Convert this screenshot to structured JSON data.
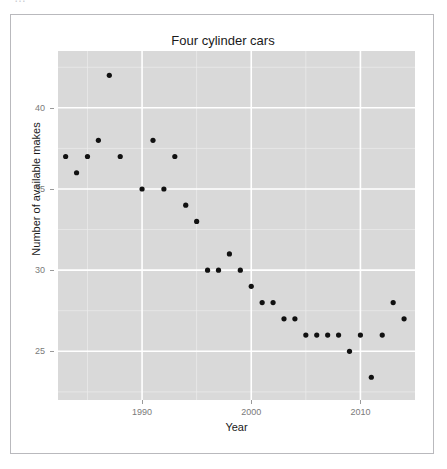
{
  "top_strip": {
    "clipped_text": "…"
  },
  "figure": {
    "title": "Four cylinder cars",
    "x_axis_title": "Year",
    "y_axis_title": "Number of available makes",
    "panel_background": "#d9d9d9",
    "point_color": "#111111",
    "major_grid_color": "#ffffff",
    "minor_grid_color": "#ececec",
    "frame_border_color": "#b9b9bd"
  },
  "chart_data": {
    "type": "scatter",
    "title": "Four cylinder cars",
    "xlabel": "Year",
    "ylabel": "Number of available makes",
    "xlim": [
      1982.2,
      1982.2
    ],
    "x_major_ticks": [
      1990,
      2000,
      2010
    ],
    "x_minor_ticks": [
      1985,
      1995,
      2005
    ],
    "y_major_ticks": [
      25,
      30,
      35,
      40
    ],
    "y_minor_ticks": [
      22.5,
      27.5,
      32.5,
      37.5,
      42.5
    ],
    "ylim": [
      22.0,
      43.5
    ],
    "x_range": [
      1982.3,
      2015.0
    ],
    "grid": true,
    "legend": "none",
    "x": [
      1983,
      1984,
      1985,
      1986,
      1987,
      1988,
      1990,
      1991,
      1992,
      1993,
      1994,
      1995,
      1996,
      1997,
      1998,
      1999,
      2000,
      2001,
      2002,
      2003,
      2004,
      2005,
      2006,
      2007,
      2008,
      2009,
      2010,
      2011,
      2012,
      2013,
      2014
    ],
    "y": [
      37,
      36,
      37,
      38,
      42,
      37,
      35,
      38,
      35,
      37,
      34,
      33,
      30,
      30,
      31,
      30,
      29,
      28,
      28,
      27,
      27,
      26,
      26,
      26,
      26,
      25,
      26,
      23.4,
      26,
      28,
      27
    ],
    "points": [
      {
        "x": 1983,
        "y": 37
      },
      {
        "x": 1984,
        "y": 36
      },
      {
        "x": 1985,
        "y": 37
      },
      {
        "x": 1986,
        "y": 38
      },
      {
        "x": 1987,
        "y": 42
      },
      {
        "x": 1988,
        "y": 37
      },
      {
        "x": 1990,
        "y": 35
      },
      {
        "x": 1991,
        "y": 38
      },
      {
        "x": 1992,
        "y": 35
      },
      {
        "x": 1993,
        "y": 37
      },
      {
        "x": 1994,
        "y": 34
      },
      {
        "x": 1995,
        "y": 33
      },
      {
        "x": 1996,
        "y": 30
      },
      {
        "x": 1997,
        "y": 30
      },
      {
        "x": 1998,
        "y": 31
      },
      {
        "x": 1999,
        "y": 30
      },
      {
        "x": 2000,
        "y": 29
      },
      {
        "x": 2001,
        "y": 28
      },
      {
        "x": 2002,
        "y": 28
      },
      {
        "x": 2003,
        "y": 27
      },
      {
        "x": 2004,
        "y": 27
      },
      {
        "x": 2005,
        "y": 26
      },
      {
        "x": 2006,
        "y": 26
      },
      {
        "x": 2007,
        "y": 26
      },
      {
        "x": 2008,
        "y": 26
      },
      {
        "x": 2009,
        "y": 25
      },
      {
        "x": 2010,
        "y": 26
      },
      {
        "x": 2011,
        "y": 23.4
      },
      {
        "x": 2012,
        "y": 26
      },
      {
        "x": 2013,
        "y": 28
      },
      {
        "x": 2014,
        "y": 27
      }
    ]
  }
}
